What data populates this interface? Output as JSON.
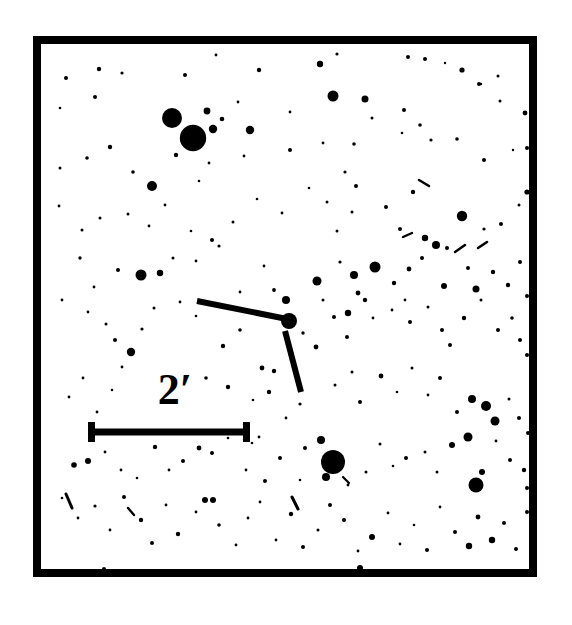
{
  "figure": {
    "kind": "astronomical-finder-chart",
    "background_color": "#ffffff",
    "ink_color": "#000000",
    "frame": {
      "x": 33,
      "y": 36,
      "width": 504,
      "height": 541,
      "border_width": 8
    }
  },
  "scale_bar": {
    "label": "2′",
    "label_text_value": "2",
    "unit_symbol": "′",
    "unit_name": "arcminutes",
    "label_x": 175,
    "label_y": 404,
    "label_font_size": 44,
    "bar_y": 432,
    "bar_x_start": 88,
    "bar_x_end": 250,
    "bar_thickness": 7,
    "cap_height": 20,
    "cap_thickness": 7
  },
  "target_marker": {
    "description": "two tick marks pointing at the target star",
    "ticks": [
      {
        "name": "horizontal-tick",
        "x1": 197,
        "y1": 301,
        "x2": 287,
        "y2": 319,
        "width": 6
      },
      {
        "name": "vertical-tick",
        "x1": 285,
        "y1": 331,
        "x2": 301,
        "y2": 392,
        "width": 6
      }
    ],
    "target_star": {
      "cx": 289,
      "cy": 321,
      "r": 8
    }
  },
  "chart_data": {
    "type": "scatter",
    "title": "",
    "xlabel": "",
    "ylabel": "",
    "grid": false,
    "legend": null,
    "axis_note": "sky image, no numeric axes; positions are pixel coordinates within frame",
    "xlim": [
      41,
      529
    ],
    "ylim": [
      44,
      569
    ],
    "point_units": "pixels",
    "series_name": "stars",
    "stars": [
      [
        66,
        78,
        2.0
      ],
      [
        99,
        69,
        2.2
      ],
      [
        122,
        73,
        1.6
      ],
      [
        185,
        75,
        2.0
      ],
      [
        216,
        55,
        1.4
      ],
      [
        259,
        70,
        2.2
      ],
      [
        320,
        64,
        3.2
      ],
      [
        337,
        54,
        1.6
      ],
      [
        408,
        57,
        2.0
      ],
      [
        425,
        59,
        2.0
      ],
      [
        365,
        99,
        3.5
      ],
      [
        462,
        70,
        2.6
      ],
      [
        445,
        63,
        1.2
      ],
      [
        498,
        76,
        1.5
      ],
      [
        479,
        84,
        2.0
      ],
      [
        60,
        108,
        1.3
      ],
      [
        95,
        97,
        2.0
      ],
      [
        172,
        118,
        10.0
      ],
      [
        193,
        138,
        13.2
      ],
      [
        213,
        129,
        4.2
      ],
      [
        207,
        111,
        3.4
      ],
      [
        222,
        119,
        2.3
      ],
      [
        238,
        102,
        1.4
      ],
      [
        250,
        130,
        4.2
      ],
      [
        290,
        112,
        1.4
      ],
      [
        333,
        96,
        5.5
      ],
      [
        354,
        144,
        1.8
      ],
      [
        372,
        118,
        1.5
      ],
      [
        404,
        110,
        2.0
      ],
      [
        420,
        125,
        1.8
      ],
      [
        481,
        84,
        1.2
      ],
      [
        525,
        113,
        2.4
      ],
      [
        500,
        101,
        1.5
      ],
      [
        60,
        168,
        1.5
      ],
      [
        87,
        158,
        1.8
      ],
      [
        110,
        147,
        2.2
      ],
      [
        133,
        172,
        1.8
      ],
      [
        152,
        186,
        5.0
      ],
      [
        176,
        155,
        2.2
      ],
      [
        199,
        181,
        1.3
      ],
      [
        209,
        163,
        1.4
      ],
      [
        244,
        156,
        1.4
      ],
      [
        290,
        150,
        2.0
      ],
      [
        309,
        188,
        1.3
      ],
      [
        323,
        143,
        1.4
      ],
      [
        345,
        172,
        1.6
      ],
      [
        356,
        186,
        2.0
      ],
      [
        402,
        133,
        1.3
      ],
      [
        431,
        140,
        1.6
      ],
      [
        457,
        139,
        1.8
      ],
      [
        484,
        160,
        2.0
      ],
      [
        513,
        150,
        1.2
      ],
      [
        527,
        148,
        2.0
      ],
      [
        59,
        206,
        1.4
      ],
      [
        82,
        230,
        1.5
      ],
      [
        100,
        218,
        1.5
      ],
      [
        128,
        214,
        1.5
      ],
      [
        149,
        226,
        1.4
      ],
      [
        165,
        205,
        1.4
      ],
      [
        191,
        231,
        1.3
      ],
      [
        212,
        240,
        2.0
      ],
      [
        233,
        222,
        1.5
      ],
      [
        257,
        199,
        1.3
      ],
      [
        282,
        213,
        1.4
      ],
      [
        327,
        202,
        1.5
      ],
      [
        337,
        231,
        1.5
      ],
      [
        352,
        212,
        1.5
      ],
      [
        386,
        207,
        2.0
      ],
      [
        400,
        229,
        2.0
      ],
      [
        413,
        192,
        2.2
      ],
      [
        425,
        238,
        3.2
      ],
      [
        436,
        245,
        4.0
      ],
      [
        462,
        216,
        5.2
      ],
      [
        447,
        248,
        2.0
      ],
      [
        484,
        229,
        1.6
      ],
      [
        501,
        224,
        2.0
      ],
      [
        519,
        205,
        1.5
      ],
      [
        527,
        192,
        2.6
      ],
      [
        80,
        258,
        1.7
      ],
      [
        94,
        287,
        1.4
      ],
      [
        118,
        270,
        2.0
      ],
      [
        141,
        275,
        5.5
      ],
      [
        160,
        273,
        3.2
      ],
      [
        173,
        258,
        1.5
      ],
      [
        196,
        261,
        1.4
      ],
      [
        219,
        246,
        1.6
      ],
      [
        240,
        292,
        1.4
      ],
      [
        264,
        266,
        1.4
      ],
      [
        286,
        300,
        4.0
      ],
      [
        274,
        290,
        1.9
      ],
      [
        317,
        281,
        4.5
      ],
      [
        340,
        262,
        1.6
      ],
      [
        354,
        275,
        4.0
      ],
      [
        358,
        293,
        2.4
      ],
      [
        375,
        267,
        5.5
      ],
      [
        394,
        283,
        2.2
      ],
      [
        409,
        269,
        2.4
      ],
      [
        422,
        258,
        2.0
      ],
      [
        444,
        286,
        3.0
      ],
      [
        468,
        268,
        2.0
      ],
      [
        476,
        289,
        3.5
      ],
      [
        493,
        272,
        2.2
      ],
      [
        508,
        285,
        2.2
      ],
      [
        520,
        262,
        2.0
      ],
      [
        527,
        296,
        2.0
      ],
      [
        62,
        300,
        1.4
      ],
      [
        88,
        312,
        1.4
      ],
      [
        106,
        324,
        1.5
      ],
      [
        115,
        340,
        2.0
      ],
      [
        131,
        352,
        4.2
      ],
      [
        142,
        329,
        1.6
      ],
      [
        154,
        308,
        1.5
      ],
      [
        180,
        302,
        1.4
      ],
      [
        196,
        316,
        1.3
      ],
      [
        122,
        367,
        1.4
      ],
      [
        223,
        346,
        2.2
      ],
      [
        262,
        368,
        2.4
      ],
      [
        274,
        371,
        2.2
      ],
      [
        240,
        330,
        1.8
      ],
      [
        253,
        313,
        1.2
      ],
      [
        303,
        333,
        1.7
      ],
      [
        316,
        347,
        2.4
      ],
      [
        334,
        317,
        2.0
      ],
      [
        348,
        313,
        3.2
      ],
      [
        323,
        300,
        1.5
      ],
      [
        347,
        337,
        2.0
      ],
      [
        365,
        300,
        2.2
      ],
      [
        373,
        318,
        1.4
      ],
      [
        392,
        310,
        1.4
      ],
      [
        410,
        322,
        2.0
      ],
      [
        428,
        307,
        1.5
      ],
      [
        442,
        330,
        2.0
      ],
      [
        450,
        345,
        2.0
      ],
      [
        464,
        318,
        2.2
      ],
      [
        481,
        300,
        1.5
      ],
      [
        498,
        330,
        2.0
      ],
      [
        512,
        318,
        1.8
      ],
      [
        520,
        340,
        2.0
      ],
      [
        527,
        355,
        2.0
      ],
      [
        69,
        397,
        1.4
      ],
      [
        83,
        378,
        1.4
      ],
      [
        97,
        412,
        1.4
      ],
      [
        112,
        390,
        1.3
      ],
      [
        206,
        378,
        1.8
      ],
      [
        228,
        387,
        2.2
      ],
      [
        253,
        400,
        1.3
      ],
      [
        269,
        392,
        2.2
      ],
      [
        286,
        418,
        1.4
      ],
      [
        300,
        404,
        1.6
      ],
      [
        335,
        385,
        1.5
      ],
      [
        352,
        372,
        1.5
      ],
      [
        360,
        402,
        2.0
      ],
      [
        381,
        376,
        2.4
      ],
      [
        397,
        392,
        1.3
      ],
      [
        412,
        368,
        1.5
      ],
      [
        428,
        395,
        1.4
      ],
      [
        440,
        378,
        2.0
      ],
      [
        457,
        412,
        2.0
      ],
      [
        472,
        399,
        4.0
      ],
      [
        486,
        406,
        5.0
      ],
      [
        495,
        421,
        4.5
      ],
      [
        509,
        399,
        1.5
      ],
      [
        519,
        418,
        2.0
      ],
      [
        528,
        433,
        2.0
      ],
      [
        74,
        465,
        2.8
      ],
      [
        88,
        461,
        3.0
      ],
      [
        105,
        452,
        1.4
      ],
      [
        121,
        470,
        1.4
      ],
      [
        137,
        478,
        1.3
      ],
      [
        155,
        447,
        2.2
      ],
      [
        169,
        470,
        1.4
      ],
      [
        183,
        461,
        2.0
      ],
      [
        199,
        448,
        2.4
      ],
      [
        212,
        453,
        2.0
      ],
      [
        228,
        438,
        1.3
      ],
      [
        246,
        470,
        1.4
      ],
      [
        252,
        443,
        1.3
      ],
      [
        265,
        481,
        2.0
      ],
      [
        280,
        458,
        2.0
      ],
      [
        305,
        448,
        2.0
      ],
      [
        321,
        440,
        4.0
      ],
      [
        333,
        462,
        12.0
      ],
      [
        326,
        477,
        4.0
      ],
      [
        348,
        485,
        1.4
      ],
      [
        366,
        472,
        1.5
      ],
      [
        380,
        444,
        1.5
      ],
      [
        393,
        466,
        1.3
      ],
      [
        406,
        458,
        2.0
      ],
      [
        425,
        452,
        1.5
      ],
      [
        437,
        472,
        1.5
      ],
      [
        452,
        445,
        3.0
      ],
      [
        468,
        437,
        4.5
      ],
      [
        476,
        485,
        7.5
      ],
      [
        482,
        472,
        3.0
      ],
      [
        496,
        441,
        1.4
      ],
      [
        510,
        460,
        2.0
      ],
      [
        524,
        470,
        2.2
      ],
      [
        527,
        488,
        2.0
      ],
      [
        62,
        498,
        1.3
      ],
      [
        78,
        518,
        1.4
      ],
      [
        95,
        506,
        1.6
      ],
      [
        110,
        530,
        1.4
      ],
      [
        124,
        497,
        2.0
      ],
      [
        141,
        520,
        2.2
      ],
      [
        152,
        543,
        2.0
      ],
      [
        166,
        505,
        1.4
      ],
      [
        178,
        534,
        2.2
      ],
      [
        196,
        512,
        1.4
      ],
      [
        205,
        500,
        3.0
      ],
      [
        219,
        525,
        1.8
      ],
      [
        236,
        545,
        1.4
      ],
      [
        248,
        518,
        1.4
      ],
      [
        260,
        502,
        1.4
      ],
      [
        276,
        540,
        1.4
      ],
      [
        291,
        514,
        2.2
      ],
      [
        303,
        547,
        2.0
      ],
      [
        318,
        530,
        1.5
      ],
      [
        330,
        505,
        2.0
      ],
      [
        344,
        520,
        2.0
      ],
      [
        358,
        551,
        1.4
      ],
      [
        372,
        537,
        3.0
      ],
      [
        388,
        513,
        1.4
      ],
      [
        400,
        544,
        1.4
      ],
      [
        414,
        525,
        1.3
      ],
      [
        427,
        550,
        2.0
      ],
      [
        440,
        507,
        1.4
      ],
      [
        455,
        532,
        2.0
      ],
      [
        469,
        546,
        3.2
      ],
      [
        478,
        517,
        2.4
      ],
      [
        492,
        540,
        3.2
      ],
      [
        504,
        523,
        2.0
      ],
      [
        516,
        549,
        2.0
      ],
      [
        527,
        512,
        2.0
      ],
      [
        360,
        568,
        3.0
      ],
      [
        104,
        569,
        2.0
      ],
      [
        213,
        500,
        3.0
      ],
      [
        300,
        480,
        1.3
      ],
      [
        405,
        300,
        1.4
      ],
      [
        244,
        430,
        1.3
      ],
      [
        259,
        437,
        1.4
      ]
    ],
    "streaks": [
      [
        66,
        494,
        72,
        508,
        3.0
      ],
      [
        292,
        497,
        298,
        509,
        3.0
      ],
      [
        419,
        180,
        429,
        186,
        2.5
      ],
      [
        455,
        252,
        465,
        245,
        2.5
      ],
      [
        403,
        237,
        412,
        233,
        2.4
      ],
      [
        128,
        508,
        134,
        515,
        2.4
      ],
      [
        478,
        248,
        487,
        242,
        2.6
      ],
      [
        343,
        477,
        349,
        483,
        2.2
      ]
    ]
  }
}
